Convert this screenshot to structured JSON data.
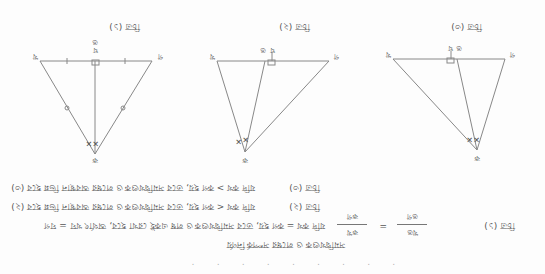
{
  "orientation": "rotated 180 degrees (scanned page upside-down)",
  "figures": [
    {
      "title": "চিত্র (১)",
      "labels": {
        "left": "খ",
        "right": "গ",
        "apex": "ক",
        "foot": "ঘ",
        "foot_alt": "ঙ"
      },
      "marks": {
        "equal_angles": "✕✕",
        "equal_sides": "○",
        "right_angle": "□"
      }
    },
    {
      "title": "চিত্র (২)",
      "labels": {
        "left": "খ",
        "right": "গ",
        "apex": "ক",
        "foot": "ঘ",
        "bisector": "ঙ"
      },
      "marks": {
        "equal_angles": "✕",
        "right_angle": "□"
      }
    },
    {
      "title": "চিত্র (৩)",
      "labels": {
        "left": "খ",
        "right": "গ",
        "apex": "ক",
        "foot": "ঘ",
        "bisector": "ঙ"
      },
      "marks": {
        "equal_angles": "✕",
        "right_angle": "□"
      }
    }
  ],
  "text_lines": [
    {
      "figure_ref": "চিত্র (১)",
      "text": "যদি কখ = কগ হয়, তবে সমদ্বিখণ্ডক ও লম্ব একই রেখা হবে, অর্থাৎ খঘ = ঘগ",
      "formula": {
        "lhs_num": "কখ",
        "lhs_den": "কগ",
        "eq": "=",
        "rhs_num": "খঙ",
        "rhs_den": "ঙগ"
      }
    },
    {
      "figure_ref": "চিত্র (২)",
      "text": "যদি কখ < কগ হয়, তবে সমদ্বিখণ্ডক ও লম্বের অবস্থান ভিন্ন হবে (২)"
    },
    {
      "figure_ref": "চিত্র (৩)",
      "text": "যদি কখ > কগ হয়, তবে সমদ্বিখণ্ডক ও লম্বের অবস্থান ভিন্ন হবে (৩)"
    },
    {
      "figure_ref": "",
      "text": "সমদ্বিখণ্ডক ও লম্বের সম্পর্ক নির্ণয়"
    }
  ]
}
